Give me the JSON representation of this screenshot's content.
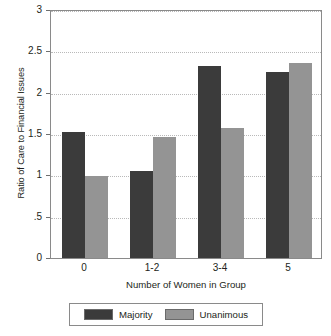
{
  "chart_data": {
    "type": "bar",
    "title": "",
    "subtitle": "",
    "xlabel": "Number of Women in Group",
    "ylabel": "Ratio of Care to Financial Issues",
    "categories": [
      "0",
      "1-2",
      "3-4",
      "5"
    ],
    "series": [
      {
        "name": "Majority",
        "values": [
          1.52,
          1.05,
          2.32,
          2.25
        ],
        "color": "#3b3b3b"
      },
      {
        "name": "Unanimous",
        "values": [
          0.99,
          1.46,
          1.57,
          2.36
        ],
        "color": "#949494"
      }
    ],
    "ylim": [
      0,
      3
    ],
    "ytick_labels": [
      "0",
      ".5",
      "1",
      "1.5",
      "2",
      "2.5",
      "3"
    ],
    "ytick_values": [
      0,
      0.5,
      1,
      1.5,
      2,
      2.5,
      3
    ],
    "grid": true,
    "grid_axis": "y",
    "legend_position": "bottom",
    "legend_entries": [
      "Majority",
      "Unanimous"
    ],
    "frame": true,
    "background": "#ffffff"
  }
}
